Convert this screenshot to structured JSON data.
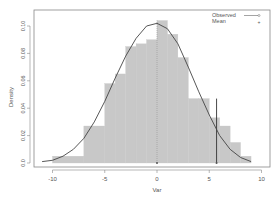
{
  "chart_data": {
    "type": "bar",
    "title": "",
    "xlabel": "Var",
    "ylabel": "Density",
    "xlim": [
      -11,
      10
    ],
    "ylim": [
      0,
      0.11
    ],
    "xticks": [
      -10,
      -5,
      0,
      5,
      10
    ],
    "yticks": [
      0.0,
      0.02,
      0.04,
      0.06,
      0.08,
      0.1
    ],
    "ytick_labels": [
      "0.0",
      "0.02",
      "0.04",
      "0.06",
      "0.08",
      "0.10"
    ],
    "grid": false,
    "legend_position": "top-right",
    "legend": [
      {
        "label": "Observed",
        "type": "line+circle"
      },
      {
        "label": "Mean",
        "type": "plus"
      }
    ],
    "histogram": {
      "bins": [
        {
          "x0": -10,
          "x1": -7,
          "density": 0.005
        },
        {
          "x0": -7,
          "x1": -5,
          "density": 0.027
        },
        {
          "x0": -5,
          "x1": -4,
          "density": 0.058
        },
        {
          "x0": -4,
          "x1": -3,
          "density": 0.065
        },
        {
          "x0": -3,
          "x1": -2,
          "density": 0.085
        },
        {
          "x0": -2,
          "x1": -1,
          "density": 0.087
        },
        {
          "x0": -1,
          "x1": 0,
          "density": 0.09
        },
        {
          "x0": 0,
          "x1": 1,
          "density": 0.104
        },
        {
          "x0": 1,
          "x1": 2,
          "density": 0.094
        },
        {
          "x0": 2,
          "x1": 3,
          "density": 0.077
        },
        {
          "x0": 3,
          "x1": 4,
          "density": 0.047
        },
        {
          "x0": 4,
          "x1": 5,
          "density": 0.047
        },
        {
          "x0": 5,
          "x1": 6,
          "density": 0.033
        },
        {
          "x0": 6,
          "x1": 7,
          "density": 0.027
        },
        {
          "x0": 7,
          "x1": 8,
          "density": 0.015
        },
        {
          "x0": 8,
          "x1": 9,
          "density": 0.005
        }
      ]
    },
    "density_curve": {
      "name": "Observed",
      "x": [
        -11,
        -10,
        -9,
        -8,
        -7,
        -6,
        -5,
        -4,
        -3,
        -2,
        -1,
        0,
        1,
        2,
        3,
        4,
        5,
        6,
        7,
        8,
        9
      ],
      "y": [
        0.001,
        0.002,
        0.005,
        0.01,
        0.018,
        0.03,
        0.045,
        0.062,
        0.078,
        0.091,
        0.1,
        0.102,
        0.098,
        0.087,
        0.07,
        0.052,
        0.035,
        0.02,
        0.01,
        0.004,
        0.001
      ]
    },
    "vertical_lines": [
      {
        "x": 0,
        "style": "dotted",
        "label": "Mean"
      },
      {
        "x": 5.7,
        "style": "solid"
      }
    ]
  }
}
